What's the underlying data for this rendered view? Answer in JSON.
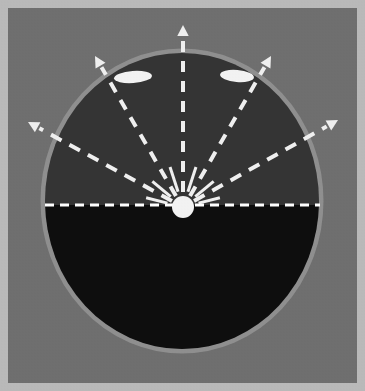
{
  "figure": {
    "domain": "diagram",
    "canvas": {
      "width": 365,
      "height": 391
    }
  },
  "colors": {
    "page_border": "#b9b9b9",
    "background_field": "#6f6f6f",
    "oval_rim": "#8f8f8f",
    "upper_hemisphere": "#343434",
    "lower_hemisphere": "#0e0e0e",
    "marker_white": "#f2f2f2",
    "ray_white": "#efefef",
    "equator_white": "#ffffff"
  },
  "border": {
    "name": "image-border",
    "inset": 8,
    "thickness": 1
  },
  "oval": {
    "name": "oval-body",
    "center_x": 182,
    "center_y": 201,
    "radius_x": 137,
    "radius_y": 148,
    "top": 53,
    "bottom": 350,
    "left": 45,
    "right": 320,
    "rim_width": 3
  },
  "equator": {
    "name": "equator-dashed-line",
    "y": 205,
    "x_start": 45,
    "x_end": 320,
    "stroke_width": 3,
    "dash": "9 6"
  },
  "source": {
    "name": "point-source",
    "cx": 183,
    "cy": 207,
    "r": 11,
    "label": "point source"
  },
  "rays": [
    {
      "name": "ray-up",
      "direction": "up",
      "angle_deg": 90,
      "tip_x": 183,
      "tip_y": 25,
      "start_x": 183,
      "start_y": 192,
      "stroke_width": 4,
      "dash": "11 9"
    },
    {
      "name": "ray-upper-left",
      "direction": "upper-left",
      "angle_deg": 124,
      "tip_x": 95,
      "tip_y": 56,
      "start_x": 176,
      "start_y": 196,
      "stroke_width": 4,
      "dash": "11 9"
    },
    {
      "name": "ray-upper-right",
      "direction": "upper-right",
      "angle_deg": 56,
      "tip_x": 271,
      "tip_y": 56,
      "start_x": 190,
      "start_y": 196,
      "stroke_width": 4,
      "dash": "11 9"
    },
    {
      "name": "ray-far-left",
      "direction": "far-left",
      "angle_deg": 155,
      "tip_x": 28,
      "tip_y": 122,
      "start_x": 172,
      "start_y": 201,
      "stroke_width": 4,
      "dash": "12 9"
    },
    {
      "name": "ray-far-right",
      "direction": "far-right",
      "angle_deg": 25,
      "tip_x": 338,
      "tip_y": 120,
      "start_x": 194,
      "start_y": 201,
      "stroke_width": 4,
      "dash": "12 9"
    }
  ],
  "short_rays": [
    {
      "name": "spoke-1",
      "angle_deg": 108,
      "length": 26
    },
    {
      "name": "spoke-2",
      "angle_deg": 72,
      "length": 26
    },
    {
      "name": "spoke-3",
      "angle_deg": 140,
      "length": 24
    },
    {
      "name": "spoke-4",
      "angle_deg": 40,
      "length": 24
    },
    {
      "name": "spoke-5",
      "angle_deg": 166,
      "length": 22
    },
    {
      "name": "spoke-6",
      "angle_deg": 14,
      "length": 22
    }
  ],
  "ellipse_markers": [
    {
      "name": "ellipse-marker-left",
      "cx": 133,
      "cy": 77,
      "rx": 19,
      "ry": 6,
      "rotation_deg": -4
    },
    {
      "name": "ellipse-marker-right",
      "cx": 237,
      "cy": 76,
      "rx": 17,
      "ry": 6,
      "rotation_deg": 5
    }
  ],
  "arrowhead": {
    "name": "arrowhead",
    "size": 11
  }
}
